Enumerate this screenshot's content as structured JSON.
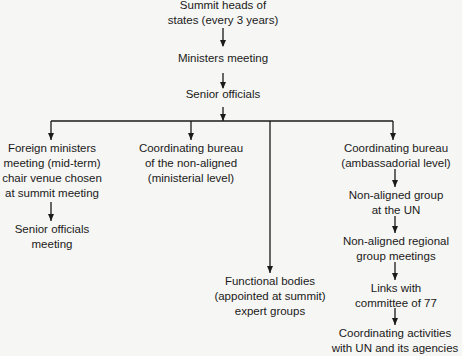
{
  "diagram": {
    "type": "organizational-flowchart",
    "nodes": {
      "summit": {
        "lines": [
          "Summit heads of",
          "states (every 3 years)"
        ]
      },
      "ministers": {
        "lines": [
          "Ministers meeting"
        ]
      },
      "senior": {
        "lines": [
          "Senior officials"
        ]
      },
      "foreign": {
        "lines": [
          "Foreign ministers",
          "meeting (mid-term)",
          "chair venue chosen",
          "at summit meeting"
        ]
      },
      "senior_meeting": {
        "lines": [
          "Senior officials",
          "meeting"
        ]
      },
      "bureau_min": {
        "lines": [
          "Coordinating bureau",
          "of the non-aligned",
          "(ministerial level)"
        ]
      },
      "functional": {
        "lines": [
          "Functional bodies",
          "(appointed at summit)",
          "expert groups"
        ]
      },
      "bureau_amb": {
        "lines": [
          "Coordinating bureau",
          "(ambassadorial level)"
        ]
      },
      "nag_un": {
        "lines": [
          "Non-aligned group",
          "at the UN"
        ]
      },
      "nag_regional": {
        "lines": [
          "Non-aligned regional",
          "group meetings"
        ]
      },
      "links77": {
        "lines": [
          "Links with",
          "committee of 77"
        ]
      },
      "coord_un": {
        "lines": [
          "Coordinating activities",
          "with UN and its agencies"
        ]
      }
    },
    "edges": [
      [
        "summit",
        "ministers"
      ],
      [
        "ministers",
        "senior"
      ],
      [
        "senior",
        "foreign"
      ],
      [
        "senior",
        "bureau_min"
      ],
      [
        "senior",
        "functional"
      ],
      [
        "senior",
        "bureau_amb"
      ],
      [
        "foreign",
        "senior_meeting"
      ],
      [
        "bureau_amb",
        "nag_un"
      ],
      [
        "nag_un",
        "nag_regional"
      ],
      [
        "nag_regional",
        "links77"
      ],
      [
        "links77",
        "coord_un"
      ]
    ],
    "line_color": "#1a1a1a"
  }
}
